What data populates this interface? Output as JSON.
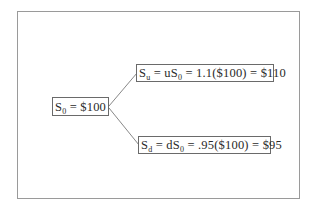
{
  "diagram": {
    "type": "binomial-tree",
    "root": {
      "symbol": "S",
      "sub": "0",
      "rest": " = $100",
      "label": "S0 = $100"
    },
    "up": {
      "symbol": "S",
      "sub": "u",
      "mid": " = uS",
      "mid_sub": "0",
      "rest": " = 1.1($100) = $110",
      "label": "Su = uS0 = 1.1($100) = $110"
    },
    "down": {
      "symbol": "S",
      "sub": "d",
      "mid": " = dS",
      "mid_sub": "0",
      "rest": " = .95($100) = $95",
      "label": "Sd = dS0 = .95($100) = $95"
    },
    "edges": [
      {
        "from": "root",
        "to": "up"
      },
      {
        "from": "root",
        "to": "down"
      }
    ],
    "colors": {
      "line": "#6a6a6a",
      "frame": "#9a9a9a",
      "text": "#2a2a2a"
    }
  }
}
